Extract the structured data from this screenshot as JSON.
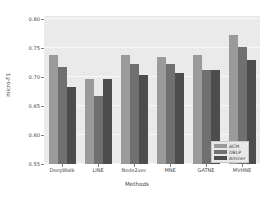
{
  "chart_data": {
    "type": "bar",
    "title": "",
    "xlabel": "Methods",
    "ylabel": "micro-F1",
    "categories": [
      "DeepWalk",
      "LINE",
      "Node2vec",
      "MNE",
      "GATNE",
      "MVHNE"
    ],
    "series": [
      {
        "name": "ACM",
        "color": "#9a9a9a",
        "values": [
          0.737,
          0.697,
          0.737,
          0.735,
          0.737,
          0.772
        ]
      },
      {
        "name": "DBLP",
        "color": "#707070",
        "values": [
          0.718,
          0.668,
          0.722,
          0.722,
          0.712,
          0.752
        ]
      },
      {
        "name": "Aminer",
        "color": "#4d4d4d",
        "values": [
          0.683,
          0.697,
          0.704,
          0.707,
          0.712,
          0.73
        ]
      }
    ],
    "ylim": [
      0.55,
      0.805
    ],
    "yticks": [
      0.8,
      0.75,
      0.7,
      0.65,
      0.6,
      0.55
    ],
    "ytick_labels": [
      "0.80",
      "0.75",
      "0.70",
      "0.65",
      "0.60",
      "0.55"
    ],
    "grid": true,
    "legend_position": "bottom-right",
    "plot_background": "#eaeaea"
  }
}
